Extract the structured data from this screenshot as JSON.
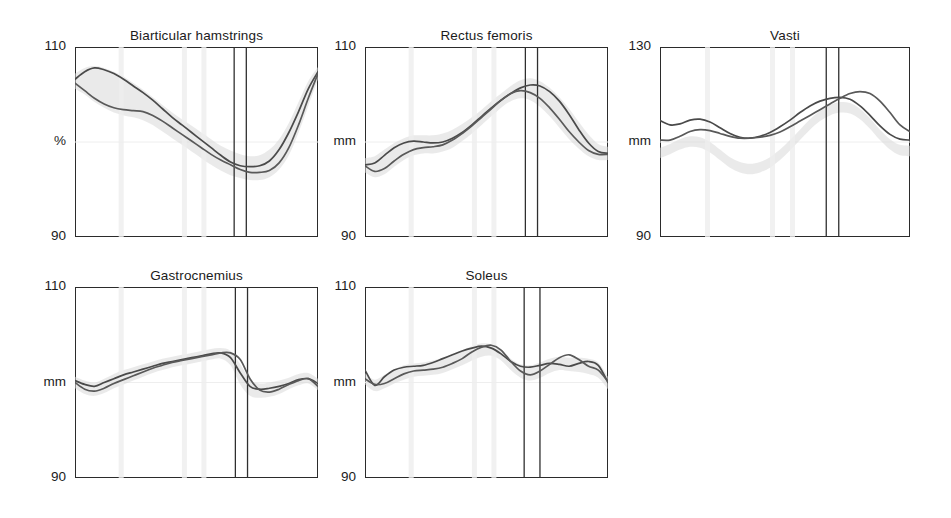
{
  "figure": {
    "background_color": "#ffffff",
    "curve_color": "#4a4a4a",
    "band_color": "#d9d9d9",
    "event_line_color": "#2f2f2f",
    "axis_color": "#2b2b2b"
  },
  "panels": [
    {
      "id": "biarticular-hamstrings",
      "title": "Biarticular hamstrings",
      "y_top_label": "110",
      "y_mid_label": "%",
      "y_bottom_label": "90",
      "y_unit": "%",
      "ylim": [
        90,
        110
      ],
      "event_lines_x_pct": [
        65.5,
        70.5
      ]
    },
    {
      "id": "rectus-femoris",
      "title": "Rectus femoris",
      "y_top_label": "110",
      "y_mid_label": "mm",
      "y_bottom_label": "90",
      "y_unit": "mm",
      "ylim": [
        90,
        110
      ],
      "event_lines_x_pct": [
        66.0,
        71.0
      ]
    },
    {
      "id": "vasti",
      "title": "Vasti",
      "y_top_label": "130",
      "y_mid_label": "mm",
      "y_bottom_label": "90",
      "y_unit": "mm",
      "ylim": [
        90,
        130
      ],
      "event_lines_x_pct": [
        66.5,
        71.5
      ]
    },
    {
      "id": "gastrocnemius",
      "title": "Gastrocnemius",
      "y_top_label": "110",
      "y_mid_label": "mm",
      "y_bottom_label": "90",
      "y_unit": "mm",
      "ylim": [
        90,
        110
      ],
      "event_lines_x_pct": [
        66.0,
        71.0
      ]
    },
    {
      "id": "soleus",
      "title": "Soleus",
      "y_top_label": "110",
      "y_mid_label": "mm",
      "y_bottom_label": "90",
      "y_unit": "mm",
      "ylim": [
        90,
        110
      ],
      "event_lines_x_pct": [
        65.5,
        72.0
      ]
    }
  ],
  "chart_data": [
    {
      "type": "line",
      "title": "Biarticular hamstrings",
      "ylabel": "%",
      "xlabel": "",
      "ylim": [
        90,
        110
      ],
      "grid": false,
      "legend": "none",
      "x": [
        0,
        4,
        8,
        12,
        16,
        20,
        24,
        28,
        32,
        36,
        40,
        44,
        48,
        52,
        56,
        60,
        64,
        68,
        72,
        76,
        80,
        84,
        88,
        92,
        96,
        100
      ],
      "series": [
        {
          "name": "trace-1",
          "values": [
            106.6,
            107.4,
            107.8,
            107.6,
            107.2,
            106.6,
            105.9,
            105.2,
            104.4,
            103.5,
            102.6,
            101.8,
            101.0,
            100.2,
            99.4,
            98.6,
            97.9,
            97.5,
            97.4,
            97.5,
            98.0,
            99.2,
            101.0,
            103.2,
            105.6,
            107.4
          ]
        },
        {
          "name": "trace-2",
          "values": [
            106.2,
            105.4,
            104.6,
            104.0,
            103.6,
            103.4,
            103.3,
            103.2,
            102.8,
            102.2,
            101.5,
            100.8,
            100.1,
            99.4,
            98.7,
            98.1,
            97.6,
            97.1,
            96.8,
            96.8,
            97.0,
            97.8,
            99.4,
            101.8,
            104.6,
            107.2
          ]
        }
      ],
      "band": {
        "name": "normal-range",
        "upper": [
          107.2,
          107.8,
          108.0,
          107.8,
          107.4,
          106.9,
          106.2,
          105.5,
          104.7,
          103.9,
          103.1,
          102.4,
          101.7,
          101.0,
          100.3,
          99.6,
          99.1,
          98.7,
          98.5,
          98.6,
          99.2,
          100.3,
          102.0,
          104.2,
          106.4,
          107.9
        ],
        "lower": [
          105.6,
          105.0,
          104.2,
          103.6,
          103.1,
          102.8,
          102.6,
          102.3,
          101.8,
          101.1,
          100.4,
          99.7,
          99.0,
          98.3,
          97.6,
          97.0,
          96.5,
          96.2,
          96.0,
          96.0,
          96.3,
          97.1,
          98.6,
          101.0,
          103.8,
          106.6
        ]
      },
      "event_lines": [
        65.5,
        70.5
      ]
    },
    {
      "type": "line",
      "title": "Rectus femoris",
      "ylabel": "mm",
      "xlabel": "",
      "ylim": [
        90,
        110
      ],
      "grid": false,
      "legend": "none",
      "x": [
        0,
        4,
        8,
        12,
        16,
        20,
        24,
        28,
        32,
        36,
        40,
        44,
        48,
        52,
        56,
        60,
        64,
        68,
        72,
        76,
        80,
        84,
        88,
        92,
        96,
        100
      ],
      "series": [
        {
          "name": "trace-1",
          "values": [
            97.6,
            97.8,
            98.6,
            99.4,
            99.9,
            100.1,
            100.0,
            99.9,
            100.0,
            100.4,
            101.0,
            101.8,
            102.7,
            103.6,
            104.4,
            105.1,
            105.7,
            106.0,
            105.9,
            105.3,
            104.3,
            102.9,
            101.3,
            99.9,
            99.0,
            98.8
          ]
        },
        {
          "name": "trace-2",
          "values": [
            97.5,
            96.9,
            97.2,
            98.0,
            98.7,
            99.2,
            99.4,
            99.5,
            99.7,
            100.2,
            100.9,
            101.7,
            102.6,
            103.5,
            104.4,
            105.1,
            105.4,
            105.2,
            104.6,
            103.6,
            102.4,
            101.1,
            100.0,
            99.1,
            98.7,
            98.7
          ]
        }
      ],
      "band": {
        "name": "normal-range",
        "upper": [
          98.3,
          98.5,
          99.2,
          99.9,
          100.4,
          100.7,
          100.7,
          100.7,
          100.9,
          101.3,
          101.9,
          102.6,
          103.4,
          104.3,
          105.1,
          105.9,
          106.5,
          106.7,
          106.4,
          105.7,
          104.7,
          103.5,
          102.1,
          100.8,
          99.8,
          99.5
        ],
        "lower": [
          96.8,
          96.3,
          96.6,
          97.4,
          98.1,
          98.6,
          98.8,
          98.8,
          99.0,
          99.4,
          100.1,
          100.9,
          101.8,
          102.7,
          103.6,
          104.3,
          104.6,
          104.4,
          103.7,
          102.7,
          101.5,
          100.3,
          99.3,
          98.5,
          98.1,
          98.1
        ]
      },
      "event_lines": [
        66.0,
        71.0
      ]
    },
    {
      "type": "line",
      "title": "Vasti",
      "ylabel": "mm",
      "xlabel": "",
      "ylim": [
        90,
        130
      ],
      "grid": false,
      "legend": "none",
      "x": [
        0,
        4,
        8,
        12,
        16,
        20,
        24,
        28,
        32,
        36,
        40,
        44,
        48,
        52,
        56,
        60,
        64,
        68,
        72,
        76,
        80,
        84,
        88,
        92,
        96,
        100
      ],
      "series": [
        {
          "name": "trace-1",
          "values": [
            114.5,
            113.6,
            113.8,
            114.6,
            114.8,
            114.2,
            113.0,
            111.8,
            111.0,
            110.8,
            111.2,
            112.0,
            113.2,
            114.6,
            116.2,
            117.6,
            118.6,
            119.2,
            119.4,
            119.0,
            117.6,
            115.6,
            113.4,
            111.6,
            110.6,
            110.4
          ]
        },
        {
          "name": "trace-2",
          "values": [
            110.4,
            110.4,
            111.2,
            112.2,
            112.6,
            112.4,
            111.8,
            111.2,
            110.8,
            110.8,
            111.0,
            111.4,
            112.1,
            113.2,
            114.4,
            115.6,
            116.8,
            118.0,
            119.2,
            120.2,
            120.6,
            120.2,
            118.6,
            116.2,
            113.6,
            112.2
          ]
        }
      ],
      "band": {
        "name": "normal-range",
        "upper": [
          108.8,
          109.6,
          110.6,
          111.2,
          111.0,
          110.0,
          108.4,
          106.8,
          105.8,
          105.4,
          105.8,
          106.8,
          108.4,
          110.4,
          112.6,
          114.8,
          116.6,
          117.8,
          118.4,
          118.2,
          117.0,
          115.0,
          112.6,
          110.6,
          109.4,
          109.2
        ],
        "lower": [
          106.6,
          107.4,
          108.4,
          109.0,
          108.8,
          107.8,
          106.2,
          104.6,
          103.6,
          103.2,
          103.6,
          104.6,
          106.2,
          108.2,
          110.4,
          112.6,
          114.4,
          115.6,
          116.2,
          116.0,
          114.8,
          112.8,
          110.4,
          108.4,
          107.2,
          107.0
        ]
      },
      "event_lines": [
        66.5,
        71.5
      ]
    },
    {
      "type": "line",
      "title": "Gastrocnemius",
      "ylabel": "mm",
      "xlabel": "",
      "ylim": [
        90,
        110
      ],
      "grid": false,
      "legend": "none",
      "x": [
        0,
        4,
        8,
        12,
        16,
        20,
        24,
        28,
        32,
        36,
        40,
        44,
        48,
        52,
        56,
        60,
        64,
        68,
        72,
        76,
        80,
        84,
        88,
        92,
        96,
        100
      ],
      "series": [
        {
          "name": "trace-1",
          "values": [
            100.2,
            99.8,
            99.6,
            100.0,
            100.4,
            100.8,
            101.1,
            101.4,
            101.7,
            102.0,
            102.2,
            102.4,
            102.6,
            102.8,
            103.0,
            103.1,
            102.6,
            101.0,
            99.6,
            99.3,
            99.4,
            99.6,
            99.9,
            100.3,
            100.4,
            99.9
          ]
        },
        {
          "name": "trace-2",
          "values": [
            100.0,
            99.3,
            99.1,
            99.4,
            99.9,
            100.3,
            100.7,
            101.1,
            101.5,
            101.8,
            102.1,
            102.3,
            102.5,
            102.7,
            102.9,
            103.1,
            103.1,
            102.4,
            100.4,
            99.2,
            99.0,
            99.3,
            99.8,
            100.2,
            100.4,
            99.6
          ]
        }
      ],
      "band": {
        "name": "normal-range",
        "upper": [
          100.6,
          100.2,
          100.0,
          100.4,
          100.9,
          101.3,
          101.6,
          101.9,
          102.2,
          102.5,
          102.7,
          102.9,
          103.1,
          103.3,
          103.5,
          103.6,
          103.3,
          101.9,
          100.3,
          99.9,
          100.0,
          100.2,
          100.5,
          100.9,
          101.0,
          100.4
        ],
        "lower": [
          99.4,
          98.8,
          98.6,
          98.9,
          99.4,
          99.8,
          100.2,
          100.6,
          101.0,
          101.3,
          101.6,
          101.8,
          102.0,
          102.2,
          102.4,
          102.5,
          101.8,
          99.8,
          98.6,
          98.4,
          98.5,
          98.8,
          99.3,
          99.7,
          99.9,
          99.2
        ]
      },
      "event_lines": [
        66.0,
        71.0
      ]
    },
    {
      "type": "line",
      "title": "Soleus",
      "ylabel": "mm",
      "xlabel": "",
      "ylim": [
        90,
        110
      ],
      "grid": false,
      "legend": "none",
      "x": [
        0,
        4,
        8,
        12,
        16,
        20,
        24,
        28,
        32,
        36,
        40,
        44,
        48,
        52,
        56,
        60,
        64,
        68,
        72,
        76,
        80,
        84,
        88,
        92,
        96,
        100
      ],
      "series": [
        {
          "name": "trace-1",
          "values": [
            101.3,
            99.7,
            100.6,
            101.3,
            101.6,
            101.7,
            101.8,
            102.1,
            102.5,
            102.9,
            103.3,
            103.6,
            103.8,
            103.6,
            103.0,
            102.2,
            101.7,
            101.6,
            101.8,
            102.0,
            101.9,
            101.7,
            102.0,
            102.2,
            101.8,
            100.0
          ]
        },
        {
          "name": "trace-2",
          "values": [
            100.4,
            99.8,
            99.9,
            100.4,
            100.9,
            101.2,
            101.3,
            101.4,
            101.6,
            102.0,
            102.5,
            103.2,
            103.7,
            103.9,
            103.4,
            102.2,
            101.2,
            100.8,
            101.2,
            101.9,
            102.6,
            102.9,
            102.4,
            101.7,
            101.3,
            100.1
          ]
        }
      ],
      "band": {
        "name": "normal-range",
        "upper": [
          101.0,
          100.3,
          100.8,
          101.4,
          101.8,
          102.0,
          102.1,
          102.3,
          102.6,
          103.0,
          103.4,
          103.8,
          104.1,
          104.0,
          103.4,
          102.5,
          101.9,
          101.8,
          102.1,
          102.5,
          102.7,
          102.6,
          102.6,
          102.5,
          102.1,
          100.6
        ],
        "lower": [
          99.8,
          99.1,
          99.4,
          99.9,
          100.3,
          100.6,
          100.7,
          100.8,
          101.0,
          101.4,
          101.8,
          102.3,
          102.7,
          102.8,
          102.3,
          101.3,
          100.5,
          100.2,
          100.5,
          101.0,
          101.3,
          101.2,
          101.1,
          100.9,
          100.5,
          99.3
        ]
      },
      "event_lines": [
        65.5,
        72.0
      ]
    }
  ]
}
